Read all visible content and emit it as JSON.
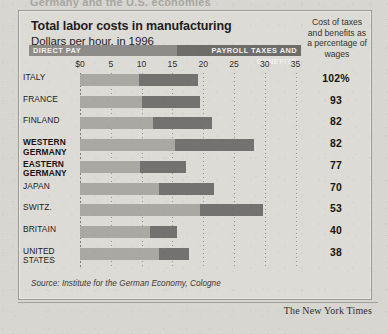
{
  "clipped_headline_above": "Germany and the U.S. economies",
  "panel": {
    "title": "Total labor costs in manufacturing",
    "subtitle": "Dollars per hour, in 1996",
    "sidenote": "Cost of taxes and benefits as a percentage of wages",
    "source": "Source: Institute for the German Economy, Cologne"
  },
  "legend": {
    "direct_pay": "DIRECT PAY",
    "payroll": "PAYROLL TAXES AND BENEFITS",
    "direct_pay_color": "#a9a8a3",
    "payroll_color": "#737270"
  },
  "credit": "The New York Times",
  "chart_data": {
    "type": "bar",
    "orientation": "horizontal",
    "stacked": true,
    "title": "Total labor costs in manufacturing",
    "subtitle": "Dollars per hour, in 1996",
    "xlabel": "Dollars per hour",
    "ylabel": "",
    "xlim": [
      0,
      37
    ],
    "xticks": [
      0,
      5,
      10,
      15,
      20,
      25,
      30,
      35
    ],
    "xtick_labels": [
      "$0",
      "5",
      "10",
      "15",
      "20",
      "25",
      "30",
      "35"
    ],
    "grid": "vertical dotted",
    "legend_position": "top",
    "categories": [
      "ITALY",
      "FRANCE",
      "FINLAND",
      "WESTERN GERMANY",
      "EASTERN GERMANY",
      "JAPAN",
      "SWITZ.",
      "BRITAIN",
      "UNITED STATES"
    ],
    "series": [
      {
        "name": "DIRECT PAY",
        "values": [
          9.5,
          10.1,
          11.8,
          15.5,
          9.7,
          12.8,
          19.4,
          11.3,
          12.8
        ]
      },
      {
        "name": "PAYROLL TAXES AND BENEFITS",
        "values": [
          9.7,
          9.4,
          9.7,
          12.7,
          7.5,
          9.0,
          10.3,
          4.5,
          4.9
        ]
      }
    ],
    "annotations": {
      "label": "Cost of taxes and benefits as a percentage of wages",
      "values": [
        "102%",
        "93",
        "82",
        "82",
        "77",
        "70",
        "53",
        "40",
        "38"
      ]
    },
    "source": "Source: Institute for the German Economy, Cologne"
  },
  "rows": [
    {
      "label": "ITALY",
      "bold": false,
      "pct": "102%"
    },
    {
      "label": "FRANCE",
      "bold": false,
      "pct": "93"
    },
    {
      "label": "FINLAND",
      "bold": false,
      "pct": "82"
    },
    {
      "label": "WESTERN GERMANY",
      "bold": true,
      "pct": "82"
    },
    {
      "label": "EASTERN GERMANY",
      "bold": true,
      "pct": "77"
    },
    {
      "label": "JAPAN",
      "bold": false,
      "pct": "70"
    },
    {
      "label": "SWITZ.",
      "bold": false,
      "pct": "53"
    },
    {
      "label": "BRITAIN",
      "bold": false,
      "pct": "40"
    },
    {
      "label": "UNITED STATES",
      "bold": false,
      "pct": "38"
    }
  ]
}
